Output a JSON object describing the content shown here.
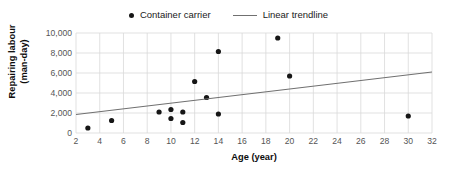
{
  "chart_data": {
    "type": "scatter",
    "title": "",
    "xlabel": "Age (year)",
    "ylabel": "Repairing labour\n(man-day)",
    "ylabel_line1": "Repairing labour",
    "ylabel_line2": "(man-day)",
    "xlim": [
      2,
      32
    ],
    "ylim": [
      0,
      10000
    ],
    "xticks": [
      2,
      4,
      6,
      8,
      10,
      12,
      14,
      16,
      18,
      20,
      22,
      24,
      26,
      28,
      30,
      32
    ],
    "xtick_labels": [
      "2",
      "4",
      "6",
      "8",
      "10",
      "12",
      "14",
      "16",
      "18",
      "20",
      "22",
      "24",
      "26",
      "28",
      "30",
      "32"
    ],
    "yticks": [
      0,
      2000,
      4000,
      6000,
      8000,
      10000
    ],
    "ytick_labels": [
      "0",
      "2,000",
      "4,000",
      "6,000",
      "8,000",
      "10,000"
    ],
    "grid": true,
    "grid_color": "#d9d9d9",
    "legend_position": "top-center",
    "series": [
      {
        "name": "Container carrier",
        "type": "scatter",
        "marker": "circle",
        "color": "#161616",
        "points": [
          {
            "x": 3,
            "y": 500
          },
          {
            "x": 5,
            "y": 1250
          },
          {
            "x": 9,
            "y": 2100
          },
          {
            "x": 10,
            "y": 2350
          },
          {
            "x": 10,
            "y": 1450
          },
          {
            "x": 11,
            "y": 2100
          },
          {
            "x": 11,
            "y": 1050
          },
          {
            "x": 12,
            "y": 5150
          },
          {
            "x": 13,
            "y": 3550
          },
          {
            "x": 14,
            "y": 8150
          },
          {
            "x": 14,
            "y": 1900
          },
          {
            "x": 19,
            "y": 9500
          },
          {
            "x": 20,
            "y": 5700
          },
          {
            "x": 30,
            "y": 1700
          }
        ]
      },
      {
        "name": "Linear trendline",
        "type": "line",
        "color": "#707070",
        "points": [
          {
            "x": 2,
            "y": 1850
          },
          {
            "x": 32,
            "y": 6100
          }
        ]
      }
    ]
  },
  "legend": {
    "entries": [
      {
        "label": "Container carrier",
        "marker": "dot"
      },
      {
        "label": "Linear trendline",
        "marker": "line"
      }
    ]
  },
  "axes": {
    "x_title": "Age (year)",
    "y_title_line1": "Repairing labour",
    "y_title_line2": "(man-day)"
  }
}
